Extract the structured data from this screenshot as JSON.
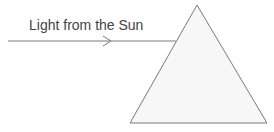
{
  "diagram": {
    "label": "Light from the Sun",
    "colors": {
      "line": "#7a7a7a",
      "text": "#444444",
      "prism_fill": "#f6f6f6"
    }
  }
}
